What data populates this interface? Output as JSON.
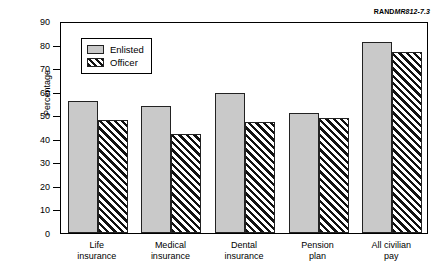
{
  "source_tag": {
    "brand": "RAND",
    "docid": "MR812-7.3"
  },
  "chart_data": {
    "type": "bar",
    "title": "",
    "xlabel": "",
    "ylabel": "Percentage",
    "ylim": [
      0,
      90
    ],
    "ytick_values": [
      0,
      10,
      20,
      30,
      40,
      50,
      60,
      70,
      80,
      90
    ],
    "ytick_labels": [
      "0",
      "10",
      "20",
      "30",
      "40",
      "50",
      "60",
      "70",
      "80",
      "90"
    ],
    "grid": false,
    "legend_position": "upper-left-inside",
    "categories": [
      "Life\ninsurance",
      "Medical\ninsurance",
      "Dental\ninsurance",
      "Pension\nplan",
      "All civilian\npay"
    ],
    "series": [
      {
        "name": "Enlisted",
        "color": "#c9c9c9",
        "pattern": "solid",
        "values": [
          56,
          54,
          59.5,
          51,
          81
        ]
      },
      {
        "name": "Officer",
        "color": "#ffffff",
        "pattern": "diagonal-hatch",
        "values": [
          48,
          42,
          47,
          49,
          77
        ]
      }
    ]
  }
}
